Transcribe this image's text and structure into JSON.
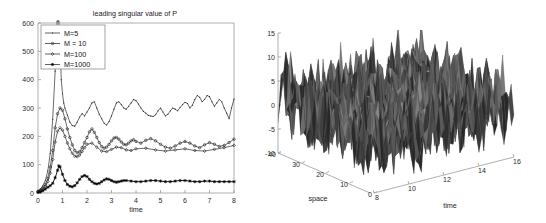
{
  "figure": {
    "background": "#ffffff",
    "panels": [
      "leading-singular-value-plot",
      "space-time-surface-plot"
    ]
  },
  "chart_data": [
    {
      "id": "left",
      "type": "line",
      "title": "leading singular value of P",
      "xlabel": "time",
      "ylabel": "",
      "xlim": [
        0,
        8
      ],
      "ylim": [
        0,
        600
      ],
      "xticks": [
        0,
        1,
        2,
        3,
        4,
        5,
        6,
        7,
        8
      ],
      "yticks": [
        0,
        100,
        200,
        300,
        400,
        500,
        600
      ],
      "grid": false,
      "legend_position": "upper-left",
      "legend": [
        "M=5",
        "M = 10",
        "M=100",
        "M=1000"
      ],
      "series": [
        {
          "name": "M=5",
          "marker": "point",
          "color": "#1b1b1b",
          "x": [
            0.0,
            0.1,
            0.2,
            0.3,
            0.4,
            0.5,
            0.6,
            0.7,
            0.78,
            0.85,
            0.9,
            0.95,
            1.0,
            1.05,
            1.1,
            1.2,
            1.3,
            1.4,
            1.5,
            1.6,
            1.7,
            1.8,
            1.9,
            2.0,
            2.1,
            2.2,
            2.3,
            2.4,
            2.5,
            2.6,
            2.7,
            2.8,
            2.9,
            3.0,
            3.1,
            3.2,
            3.3,
            3.4,
            3.5,
            3.6,
            3.7,
            3.8,
            3.9,
            4.0,
            4.1,
            4.2,
            4.3,
            4.4,
            4.5,
            4.6,
            4.7,
            4.8,
            4.9,
            5.0,
            5.1,
            5.2,
            5.3,
            5.4,
            5.5,
            5.6,
            5.7,
            5.8,
            5.9,
            6.0,
            6.1,
            6.2,
            6.3,
            6.4,
            6.5,
            6.6,
            6.7,
            6.8,
            6.9,
            7.0,
            7.1,
            7.2,
            7.3,
            7.4,
            7.5,
            7.6,
            7.7,
            7.8,
            7.9,
            8.0
          ],
          "y": [
            8,
            14,
            26,
            44,
            78,
            140,
            260,
            430,
            610,
            612,
            520,
            400,
            350,
            318,
            300,
            275,
            250,
            238,
            236,
            250,
            268,
            280,
            272,
            286,
            300,
            318,
            322,
            300,
            278,
            262,
            246,
            240,
            252,
            272,
            296,
            318,
            322,
            312,
            300,
            296,
            306,
            318,
            330,
            326,
            314,
            300,
            288,
            282,
            274,
            272,
            270,
            276,
            290,
            300,
            286,
            272,
            278,
            290,
            300,
            296,
            290,
            302,
            312,
            320,
            316,
            300,
            310,
            330,
            344,
            338,
            322,
            330,
            344,
            340,
            322,
            306,
            318,
            330,
            322,
            300,
            282,
            262,
            300,
            332
          ]
        },
        {
          "name": "M = 10",
          "marker": "circle",
          "color": "#1b1b1b",
          "x": [
            0.0,
            0.1,
            0.2,
            0.3,
            0.4,
            0.5,
            0.6,
            0.7,
            0.8,
            0.9,
            1.0,
            1.1,
            1.2,
            1.3,
            1.4,
            1.5,
            1.6,
            1.7,
            1.8,
            1.9,
            2.0,
            2.1,
            2.2,
            2.3,
            2.4,
            2.5,
            2.6,
            2.7,
            2.8,
            2.9,
            3.0,
            3.1,
            3.2,
            3.3,
            3.4,
            3.5,
            3.6,
            3.7,
            3.8,
            3.9,
            4.0,
            4.2,
            4.4,
            4.6,
            4.8,
            5.0,
            5.2,
            5.4,
            5.6,
            5.8,
            6.0,
            6.2,
            6.4,
            6.6,
            6.8,
            7.0,
            7.2,
            7.4,
            7.6,
            7.8,
            8.0
          ],
          "y": [
            6,
            10,
            18,
            30,
            52,
            92,
            150,
            230,
            280,
            300,
            292,
            262,
            226,
            196,
            170,
            150,
            142,
            146,
            160,
            178,
            196,
            216,
            226,
            214,
            196,
            178,
            164,
            158,
            162,
            172,
            184,
            194,
            196,
            190,
            180,
            172,
            170,
            176,
            184,
            188,
            182,
            176,
            186,
            192,
            184,
            172,
            162,
            158,
            166,
            176,
            182,
            176,
            166,
            160,
            170,
            178,
            172,
            164,
            168,
            178,
            190
          ]
        },
        {
          "name": "M=100",
          "marker": "diamond",
          "color": "#1b1b1b",
          "x": [
            0.0,
            0.1,
            0.2,
            0.3,
            0.4,
            0.5,
            0.6,
            0.7,
            0.8,
            0.9,
            1.0,
            1.1,
            1.2,
            1.3,
            1.4,
            1.5,
            1.6,
            1.7,
            1.8,
            1.9,
            2.0,
            2.2,
            2.4,
            2.6,
            2.8,
            3.0,
            3.2,
            3.4,
            3.6,
            3.8,
            4.0,
            4.4,
            4.8,
            5.2,
            5.6,
            6.0,
            6.4,
            6.8,
            7.2,
            7.6,
            8.0
          ],
          "y": [
            4,
            8,
            14,
            24,
            40,
            70,
            118,
            180,
            218,
            230,
            222,
            200,
            176,
            156,
            140,
            130,
            128,
            134,
            146,
            160,
            172,
            176,
            162,
            148,
            146,
            154,
            162,
            160,
            152,
            150,
            156,
            158,
            152,
            148,
            152,
            156,
            150,
            148,
            154,
            160,
            168
          ]
        },
        {
          "name": "M=1000",
          "marker": "star",
          "color": "#000000",
          "x": [
            0.0,
            0.1,
            0.2,
            0.3,
            0.4,
            0.5,
            0.6,
            0.7,
            0.8,
            0.85,
            0.9,
            1.0,
            1.1,
            1.2,
            1.3,
            1.4,
            1.5,
            1.6,
            1.7,
            1.8,
            1.9,
            2.0,
            2.1,
            2.2,
            2.3,
            2.4,
            2.5,
            2.6,
            2.7,
            2.8,
            2.9,
            3.0,
            3.1,
            3.2,
            3.3,
            3.4,
            3.5,
            3.6,
            3.8,
            4.0,
            4.2,
            4.4,
            4.6,
            4.8,
            5.0,
            5.2,
            5.4,
            5.6,
            5.8,
            6.0,
            6.2,
            6.4,
            6.6,
            6.8,
            7.0,
            7.2,
            7.4,
            7.6,
            7.8,
            8.0
          ],
          "y": [
            2,
            4,
            8,
            14,
            20,
            26,
            34,
            54,
            80,
            96,
            92,
            66,
            44,
            30,
            24,
            22,
            26,
            36,
            48,
            58,
            62,
            58,
            48,
            40,
            34,
            32,
            34,
            40,
            46,
            50,
            48,
            44,
            40,
            38,
            40,
            42,
            44,
            44,
            42,
            40,
            40,
            42,
            44,
            44,
            42,
            40,
            40,
            42,
            44,
            44,
            42,
            40,
            40,
            42,
            42,
            40,
            40,
            40,
            40,
            40
          ]
        }
      ]
    },
    {
      "id": "right",
      "type": "surface",
      "title": "",
      "xlabel": "time",
      "ylabel": "space",
      "zlabel": "",
      "xlim": [
        8,
        16
      ],
      "ylim": [
        0,
        40
      ],
      "zlim": [
        -10,
        15
      ],
      "xticks": [
        8,
        10,
        12,
        14,
        16
      ],
      "yticks": [
        0,
        10,
        20,
        30,
        40
      ],
      "zticks": [
        -10,
        -5,
        0,
        5,
        10,
        15
      ],
      "grid": false,
      "colormap": "gray",
      "description": "rough jagged grayscale mesh surface over space-time grid"
    }
  ]
}
